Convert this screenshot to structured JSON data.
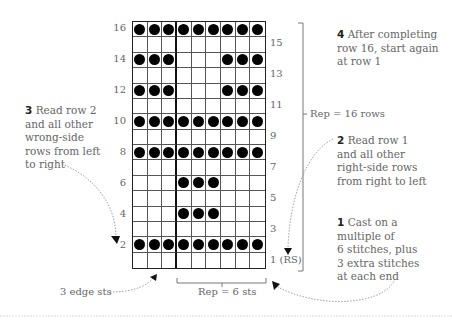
{
  "chart": {
    "columns": 9,
    "rows": 16,
    "repeat_divider_after_column": 3,
    "pattern_rows_top_to_bottom": [
      {
        "row": 16,
        "cells": [
          1,
          1,
          1,
          1,
          1,
          1,
          1,
          1,
          1
        ]
      },
      {
        "row": 15,
        "cells": [
          0,
          0,
          0,
          0,
          0,
          0,
          0,
          0,
          0
        ]
      },
      {
        "row": 14,
        "cells": [
          1,
          1,
          1,
          0,
          0,
          0,
          1,
          1,
          1
        ]
      },
      {
        "row": 13,
        "cells": [
          0,
          0,
          0,
          0,
          0,
          0,
          0,
          0,
          0
        ]
      },
      {
        "row": 12,
        "cells": [
          1,
          1,
          1,
          0,
          0,
          0,
          1,
          1,
          1
        ]
      },
      {
        "row": 11,
        "cells": [
          0,
          0,
          0,
          0,
          0,
          0,
          0,
          0,
          0
        ]
      },
      {
        "row": 10,
        "cells": [
          1,
          1,
          1,
          1,
          1,
          1,
          1,
          1,
          1
        ]
      },
      {
        "row": 9,
        "cells": [
          0,
          0,
          0,
          0,
          0,
          0,
          0,
          0,
          0
        ]
      },
      {
        "row": 8,
        "cells": [
          1,
          1,
          1,
          1,
          1,
          1,
          1,
          1,
          1
        ]
      },
      {
        "row": 7,
        "cells": [
          0,
          0,
          0,
          0,
          0,
          0,
          0,
          0,
          0
        ]
      },
      {
        "row": 6,
        "cells": [
          0,
          0,
          0,
          1,
          1,
          1,
          0,
          0,
          0
        ]
      },
      {
        "row": 5,
        "cells": [
          0,
          0,
          0,
          0,
          0,
          0,
          0,
          0,
          0
        ]
      },
      {
        "row": 4,
        "cells": [
          0,
          0,
          0,
          1,
          1,
          1,
          0,
          0,
          0
        ]
      },
      {
        "row": 3,
        "cells": [
          0,
          0,
          0,
          0,
          0,
          0,
          0,
          0,
          0
        ]
      },
      {
        "row": 2,
        "cells": [
          1,
          1,
          1,
          1,
          1,
          1,
          1,
          1,
          1
        ]
      },
      {
        "row": 1,
        "cells": [
          0,
          0,
          0,
          0,
          0,
          0,
          0,
          0,
          0
        ]
      }
    ],
    "left_row_labels": [
      "16",
      "14",
      "12",
      "10",
      "8",
      "6",
      "4",
      "2"
    ],
    "right_row_labels": [
      "15",
      "13",
      "11",
      "9",
      "7",
      "5",
      "3",
      "1 (RS)"
    ]
  },
  "labels": {
    "rep_rows": "Rep = 16 rows",
    "rep_sts": "Rep = 6 sts",
    "edge_sts": "3 edge sts"
  },
  "notes": {
    "note1": {
      "num": "1",
      "text": "Cast on a multiple of 6 stitches, plus 3 extra stitches at each end",
      "lines": [
        "Cast on a",
        "multiple of",
        "6 stitches, plus",
        "3 extra stitches",
        "at each end"
      ]
    },
    "note2": {
      "num": "2",
      "lines": [
        "Read row 1",
        "and all other",
        "right-side rows",
        "from right to left"
      ]
    },
    "note3": {
      "num": "3",
      "lines": [
        "Read row 2",
        "and all other",
        "wrong-side",
        "rows from left",
        "to right"
      ]
    },
    "note4": {
      "num": "4",
      "lines": [
        "After completing",
        "row 16, start again",
        "at row 1"
      ]
    }
  },
  "colors": {
    "stitch_dot": "#000000",
    "grid_line": "#555555",
    "text": "#666666"
  }
}
